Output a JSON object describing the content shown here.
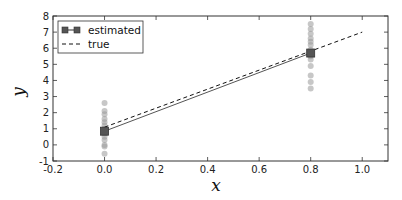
{
  "chart_data": {
    "type": "line",
    "title": "",
    "xlabel": "x",
    "ylabel": "y",
    "xlim": [
      -0.2,
      1.1
    ],
    "ylim": [
      -1,
      8
    ],
    "grid": false,
    "legend_position": "upper left",
    "xticks": [
      "-0.2",
      "0.0",
      "0.2",
      "0.4",
      "0.6",
      "0.8",
      "1.0"
    ],
    "yticks": [
      "-1",
      "0",
      "1",
      "2",
      "3",
      "4",
      "5",
      "6",
      "7",
      "8"
    ],
    "series": [
      {
        "name": "estimated",
        "style": "solid line with square markers",
        "color": "#555555",
        "x": [
          0.0,
          0.8
        ],
        "y": [
          0.85,
          5.7
        ]
      },
      {
        "name": "true",
        "style": "dashed line",
        "color": "#111111",
        "x": [
          0.0,
          1.0
        ],
        "y": [
          1.1,
          7.0
        ]
      },
      {
        "name": "samples",
        "style": "scatter, gray translucent circles",
        "color": "#999999",
        "x": [
          0,
          0,
          0,
          0,
          0,
          0,
          0,
          0,
          0,
          0,
          0,
          0,
          0,
          0.8,
          0.8,
          0.8,
          0.8,
          0.8,
          0.8,
          0.8,
          0.8,
          0.8,
          0.8,
          0.8,
          0.8,
          0.8
        ],
        "y": [
          2.6,
          2.1,
          1.9,
          1.6,
          1.4,
          1.2,
          1.0,
          0.7,
          0.5,
          0.3,
          0.0,
          -0.1,
          -0.55,
          7.5,
          7.2,
          6.9,
          6.6,
          6.4,
          6.2,
          5.9,
          5.5,
          5.3,
          4.9,
          4.3,
          3.9,
          3.5
        ]
      }
    ]
  }
}
